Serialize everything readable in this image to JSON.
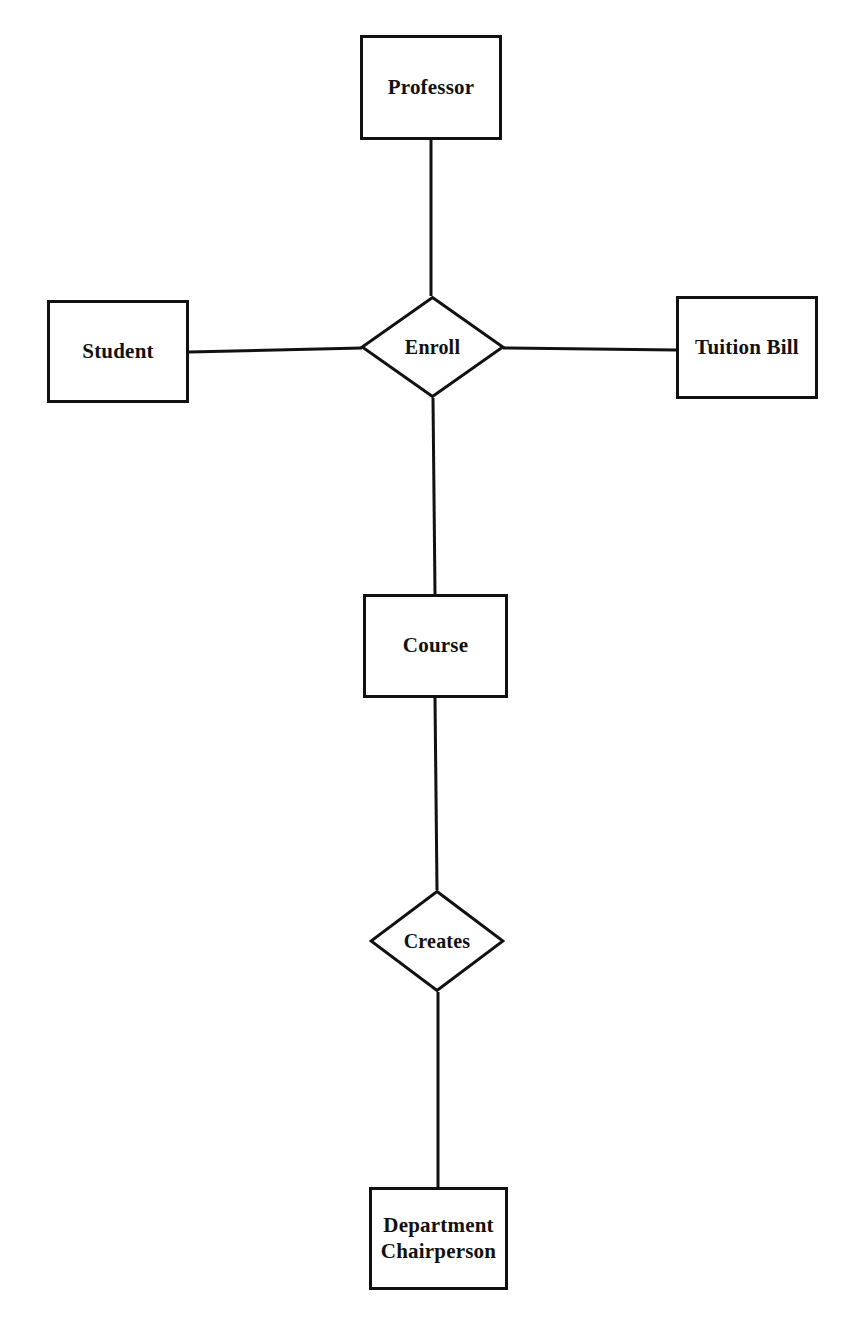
{
  "diagram": {
    "background_color": "#ffffff",
    "stroke_color": "#111111",
    "entities": [
      {
        "id": "professor",
        "label": "Professor",
        "shape": "rectangle",
        "x": 360,
        "y": 35,
        "w": 142,
        "h": 105
      },
      {
        "id": "student",
        "label": "Student",
        "shape": "rectangle",
        "x": 47,
        "y": 300,
        "w": 142,
        "h": 103
      },
      {
        "id": "tuition-bill",
        "label": "Tuition Bill",
        "shape": "rectangle",
        "x": 676,
        "y": 296,
        "w": 142,
        "h": 103
      },
      {
        "id": "course",
        "label": "Course",
        "shape": "rectangle",
        "x": 363,
        "y": 594,
        "w": 145,
        "h": 104
      },
      {
        "id": "department-chairperson",
        "label": "Department\nChairperson",
        "shape": "rectangle",
        "x": 369,
        "y": 1187,
        "w": 139,
        "h": 103
      }
    ],
    "relationships": [
      {
        "id": "enroll",
        "label": "Enroll",
        "shape": "diamond",
        "x": 360,
        "y": 296,
        "w": 145,
        "h": 102
      },
      {
        "id": "creates",
        "label": "Creates",
        "shape": "diamond",
        "x": 369,
        "y": 890,
        "w": 136,
        "h": 102
      }
    ],
    "connections": [
      {
        "id": "professor-enroll",
        "from": "professor",
        "to": "enroll",
        "points": "431,140 431,296"
      },
      {
        "id": "student-enroll",
        "from": "student",
        "to": "enroll",
        "points": "189,352 362,348"
      },
      {
        "id": "enroll-tuition-bill",
        "from": "enroll",
        "to": "tuition-bill",
        "points": "503,348 676,350"
      },
      {
        "id": "enroll-course",
        "from": "enroll",
        "to": "course",
        "points": "433,398 435,594"
      },
      {
        "id": "course-creates",
        "from": "course",
        "to": "creates",
        "points": "435,698 437,890"
      },
      {
        "id": "creates-department-chairperson",
        "from": "creates",
        "to": "department-chairperson",
        "points": "438,992 438,1187"
      }
    ]
  }
}
